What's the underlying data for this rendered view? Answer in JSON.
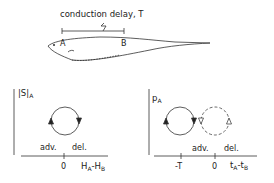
{
  "top": {
    "title": "conduction delay, T",
    "label_a": "A",
    "label_b": "B"
  },
  "left_panel": {
    "ylabel_main": "|S|",
    "ylabel_sub": "A",
    "zero_tick": "0",
    "xlabel_h1": "H",
    "xlabel_h1_sub": "A",
    "xlabel_dash": "-",
    "xlabel_h2": "H",
    "xlabel_h2_sub": "B",
    "adv_label": "adv.",
    "del_label": "del."
  },
  "right_panel": {
    "ylabel_main": "p",
    "ylabel_sub": "A",
    "minus_t_tick": "-T",
    "zero_tick": "0",
    "xlabel_t1": "t",
    "xlabel_t1_sub": "A",
    "xlabel_dash": "-",
    "xlabel_t2": "t",
    "xlabel_t2_sub": "B",
    "adv_label": "adv.",
    "del_label": "del."
  }
}
